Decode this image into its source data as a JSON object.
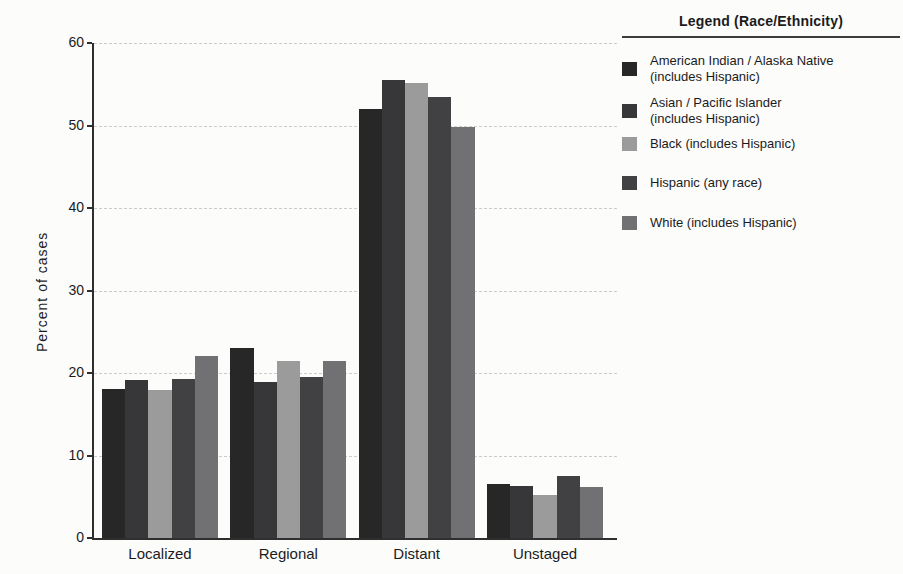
{
  "legend": {
    "title": "Legend (Race/Ethnicity)",
    "items": [
      {
        "line1": "American Indian / Alaska Native",
        "line2": "(includes Hispanic)",
        "color": "#272727"
      },
      {
        "line1": "Asian / Pacific Islander",
        "line2": "(includes Hispanic)",
        "color": "#37373a"
      },
      {
        "line1": "Black (includes Hispanic)",
        "line2": "",
        "color": "#9b9b9b"
      },
      {
        "line1": "Hispanic (any race)",
        "line2": "",
        "color": "#414144"
      },
      {
        "line1": "White (includes Hispanic)",
        "line2": "",
        "color": "#717174"
      }
    ]
  },
  "chart_data": {
    "type": "bar",
    "ylabel": "Percent of cases",
    "ylim": [
      0,
      60
    ],
    "yticks": [
      0,
      10,
      20,
      30,
      40,
      50,
      60
    ],
    "grid": true,
    "legend_title": "Legend (Race/Ethnicity)",
    "legend_position": "right",
    "categories": [
      "Localized",
      "Regional",
      "Distant",
      "Unstaged"
    ],
    "series": [
      {
        "name": "American Indian / Alaska Native (includes Hispanic)",
        "short": "american-indian-alaska-native",
        "color": "#272727",
        "values": [
          18.1,
          23.0,
          52.0,
          6.6
        ]
      },
      {
        "name": "Asian / Pacific Islander (includes Hispanic)",
        "short": "asian-pacific-islander",
        "color": "#37373a",
        "values": [
          19.2,
          18.9,
          55.5,
          6.3
        ]
      },
      {
        "name": "Black (includes Hispanic)",
        "short": "black",
        "color": "#9b9b9b",
        "values": [
          17.9,
          21.5,
          55.1,
          5.2
        ]
      },
      {
        "name": "Hispanic (any race)",
        "short": "hispanic",
        "color": "#414144",
        "values": [
          19.3,
          19.5,
          53.4,
          7.5
        ]
      },
      {
        "name": "White (includes Hispanic)",
        "short": "white",
        "color": "#717174",
        "values": [
          22.1,
          21.5,
          49.8,
          6.2
        ]
      }
    ]
  }
}
